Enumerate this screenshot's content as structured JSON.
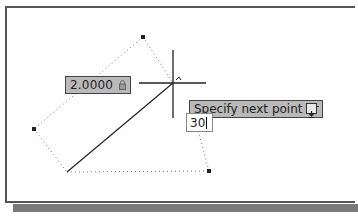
{
  "dynamic_input": {
    "distance_value": "2.0000",
    "distance_lock_icon": "lock-icon",
    "prompt_text": "Specify next point or",
    "prompt_options_icon": "down-arrow-icon",
    "angle_input_value": "30"
  },
  "drawing": {
    "line_start": [
      67,
      172
    ],
    "cursor": [
      173,
      83
    ],
    "dotted_polygon": [
      [
        143,
        37
      ],
      [
        34,
        129
      ],
      [
        67,
        172
      ],
      [
        209,
        171
      ],
      [
        173,
        83
      ]
    ]
  },
  "colors": {
    "tooltip_bg": "#b9b9b9",
    "frame": "#555555",
    "shadow": "#7a7a7a"
  }
}
